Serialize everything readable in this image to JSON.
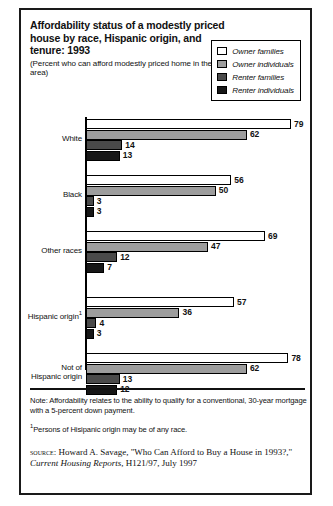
{
  "figure": {
    "title": "Affordability status of a modestly priced house by race, Hispanic origin, and tenure: 1993",
    "subtitle": "(Percent who can afford modestly priced home in their area)"
  },
  "legend": {
    "position": "top-right",
    "items": [
      {
        "label": "Owner families",
        "color": "#ffffff"
      },
      {
        "label": "Owner individuals",
        "color": "#9d9d9d"
      },
      {
        "label": "Renter families",
        "color": "#4a4a4a"
      },
      {
        "label": "Renter individuals",
        "color": "#171717"
      }
    ]
  },
  "notes": {
    "note": "Note: Affordability relates to the ability to qualify for a conventional, 30-year mortgage with a 5-percent down payment.",
    "footnote_marker": "1",
    "footnote": "Persons of Hisipanic origin may be of any race.",
    "source_prefix": "source",
    "source_sep": ": ",
    "source_part1": "Howard A. Savage, \"Who Can Afford to Buy a House in 1993?,\" ",
    "source_italic": "Current Housing Reports",
    "source_part2": ", H121/97, July 1997"
  },
  "chart_data": {
    "type": "bar",
    "orientation": "horizontal",
    "title": "Affordability status of a modestly priced house by race, Hispanic origin, and tenure: 1993",
    "subtitle": "(Percent who can afford modestly priced home in their area)",
    "xlabel": "",
    "ylabel": "",
    "xlim": [
      0,
      79
    ],
    "grid": false,
    "legend_position": "top-right",
    "categories": [
      "White",
      "Black",
      "Other races",
      "Hispanic origin",
      "Not of Hispanic origin"
    ],
    "category_labels": [
      {
        "line1": "White",
        "line2": "",
        "superscript": ""
      },
      {
        "line1": "Black",
        "line2": "",
        "superscript": ""
      },
      {
        "line1": "Other races",
        "line2": "",
        "superscript": ""
      },
      {
        "line1": "Hispanic origin",
        "line2": "",
        "superscript": "1"
      },
      {
        "line1": "Not of",
        "line2": "Hispanic origin",
        "superscript": ""
      }
    ],
    "series": [
      {
        "name": "Owner families",
        "color": "#ffffff",
        "values": [
          79,
          56,
          69,
          57,
          78
        ]
      },
      {
        "name": "Owner individuals",
        "color": "#9d9d9d",
        "values": [
          62,
          50,
          47,
          36,
          62
        ]
      },
      {
        "name": "Renter families",
        "color": "#4a4a4a",
        "values": [
          14,
          3,
          12,
          4,
          13
        ]
      },
      {
        "name": "Renter individuals",
        "color": "#171717",
        "values": [
          13,
          3,
          7,
          3,
          12
        ]
      }
    ]
  }
}
